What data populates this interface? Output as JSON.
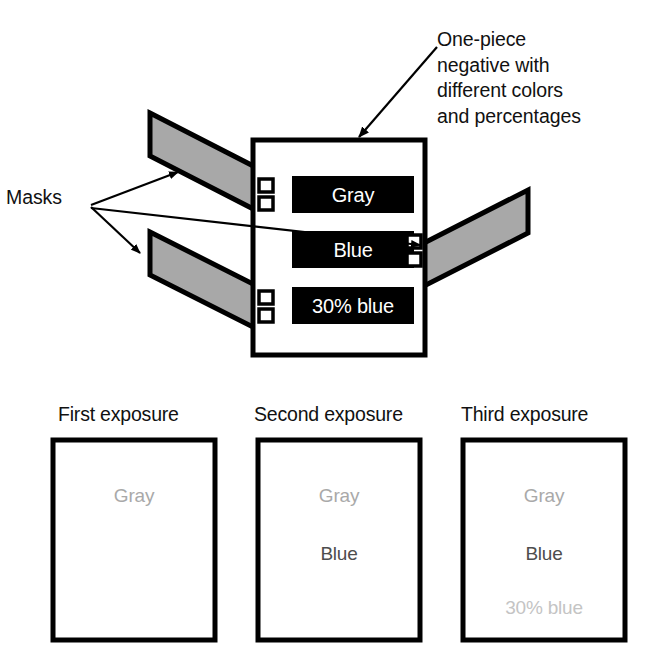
{
  "figure": {
    "type": "technical-illustration"
  },
  "callouts": {
    "negative": {
      "lines": [
        "One-piece",
        "negative with",
        "different colors",
        "and percentages"
      ],
      "text": "One-piece\nnegative with\ndifferent colors\nand percentages"
    },
    "masks_label": "Masks"
  },
  "negative": {
    "name": "one-piece-negative",
    "border_color": "#000000",
    "fill_color": "#ffffff",
    "chips": [
      {
        "label": "Gray",
        "fill": "#000000",
        "text_color": "#ffffff"
      },
      {
        "label": "Blue",
        "fill": "#000000",
        "text_color": "#ffffff"
      },
      {
        "label": "30% blue",
        "fill": "#000000",
        "text_color": "#ffffff"
      }
    ]
  },
  "masks": [
    {
      "name": "upper-left-mask",
      "fill": "#a8a8a8",
      "stroke": "#000000"
    },
    {
      "name": "lower-left-mask",
      "fill": "#a8a8a8",
      "stroke": "#000000"
    },
    {
      "name": "right-mask",
      "fill": "#a8a8a8",
      "stroke": "#000000"
    }
  ],
  "exposures": [
    {
      "title": "First exposure",
      "lines": [
        {
          "text": "Gray",
          "color": "#a9a9a9"
        }
      ]
    },
    {
      "title": "Second exposure",
      "lines": [
        {
          "text": "Gray",
          "color": "#a9a9a9"
        },
        {
          "text": "Blue",
          "color": "#4d4d4d"
        }
      ]
    },
    {
      "title": "Third exposure",
      "lines": [
        {
          "text": "Gray",
          "color": "#a9a9a9"
        },
        {
          "text": "Blue",
          "color": "#4d4d4d"
        },
        {
          "text": "30% blue",
          "color": "#c4c4c4"
        }
      ]
    }
  ],
  "colors": {
    "ink": "#000000",
    "mask_gray": "#a8a8a8",
    "paper": "#ffffff"
  }
}
